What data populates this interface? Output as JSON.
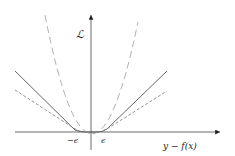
{
  "diagram": {
    "y_axis_label": "ℒ",
    "x_axis_label": "y − f(x)",
    "tick_labels": {
      "neg_epsilon": "−ϵ",
      "pos_epsilon": "ϵ"
    },
    "curves": [
      {
        "name": "epsilon-insensitive-loss",
        "style": "solid",
        "color": "#555555"
      },
      {
        "name": "huber-loss",
        "style": "short-dashed",
        "color": "#888888"
      },
      {
        "name": "squared-loss",
        "style": "long-dashed",
        "color": "#b0b0b0"
      }
    ]
  }
}
